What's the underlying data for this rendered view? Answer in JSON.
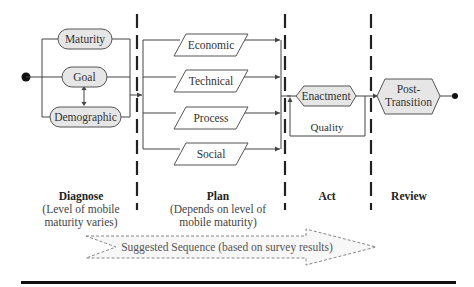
{
  "diagram": {
    "colors": {
      "node_fill": "#e6e6e6",
      "node_stroke": "#555555",
      "line": "#444444",
      "divider": "#222222",
      "rule": "#111111"
    },
    "start_node": "start-dot",
    "end_node": "end-dot",
    "diagnose_nodes": [
      "Maturity",
      "Goal",
      "Demographic"
    ],
    "plan_nodes": [
      "Economic",
      "Technical",
      "Process",
      "Social"
    ],
    "act_node": "Enactment",
    "act_loop_label": "Quality",
    "review_node": {
      "line1": "Post-",
      "line2": "Transition"
    },
    "phases": [
      {
        "title": "Diagnose",
        "sub1": "(Level of mobile",
        "sub2": "maturity varies)"
      },
      {
        "title": "Plan",
        "sub1": "(Depends on level of",
        "sub2": "mobile maturity)"
      },
      {
        "title": "Act",
        "sub1": "",
        "sub2": ""
      },
      {
        "title": "Review",
        "sub1": "",
        "sub2": ""
      }
    ],
    "sequence_arrow_label": "Suggested Sequence (based on survey results)"
  }
}
